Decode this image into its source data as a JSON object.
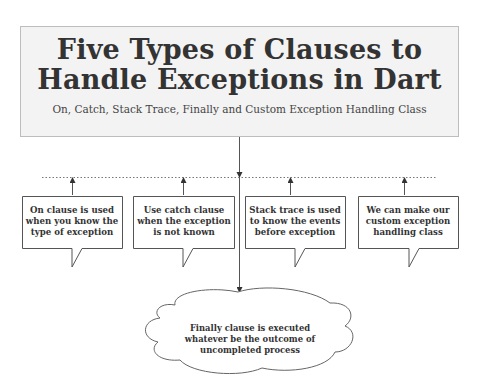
{
  "header": {
    "title_line1": "Five Types of Clauses to",
    "title_line2": "Handle Exceptions in Dart",
    "subtitle": "On, Catch, Stack Trace, Finally and Custom Exception Handling Class"
  },
  "callouts": [
    {
      "label": "On clause is used when you know the type of exception"
    },
    {
      "label": "Use catch clause when the exception is not known"
    },
    {
      "label": "Stack trace is used to know the events before exception"
    },
    {
      "label": "We can make our custom exception handling class"
    }
  ],
  "cloud": {
    "label": "Finally clause is executed whatever be the outcome of uncompleted process"
  },
  "colors": {
    "header_bg": "#f3f3f3",
    "header_border": "#bdbdbd",
    "line": "#555555",
    "text": "#333333"
  }
}
